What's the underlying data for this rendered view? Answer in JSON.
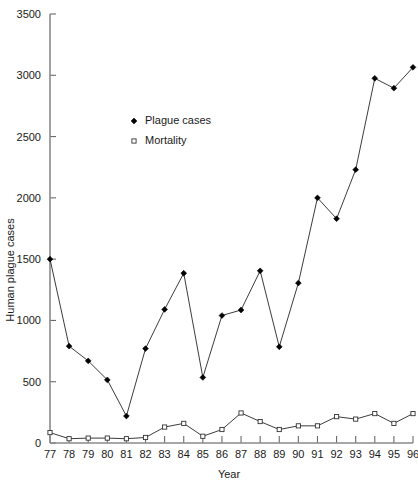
{
  "chart_data": {
    "type": "line",
    "title": "",
    "xlabel": "Year",
    "ylabel": "Human plague cases",
    "categories": [
      "77",
      "78",
      "79",
      "80",
      "81",
      "82",
      "83",
      "84",
      "85",
      "86",
      "87",
      "88",
      "89",
      "90",
      "91",
      "92",
      "93",
      "94",
      "95",
      "96"
    ],
    "x": [
      77,
      78,
      79,
      80,
      81,
      82,
      83,
      84,
      85,
      86,
      87,
      88,
      89,
      90,
      91,
      92,
      93,
      94,
      95,
      96
    ],
    "xlim": [
      77,
      96
    ],
    "ylim": [
      0,
      3500
    ],
    "yticks": [
      0,
      500,
      1000,
      1500,
      2000,
      2500,
      3000,
      3500
    ],
    "ytick_labels": [
      "0",
      "500",
      "1000",
      "1500",
      "2000",
      "2500",
      "3000",
      "3500"
    ],
    "grid": false,
    "legend_position": "upper-left-inside",
    "series": [
      {
        "name": "Plague cases",
        "marker": "filled-diamond",
        "values": [
          1500,
          790,
          670,
          515,
          220,
          770,
          1090,
          1385,
          535,
          1040,
          1085,
          1405,
          785,
          1305,
          2000,
          1830,
          2230,
          2975,
          2895,
          3065
        ]
      },
      {
        "name": "Mortality",
        "marker": "open-square",
        "values": [
          85,
          35,
          40,
          40,
          35,
          45,
          130,
          160,
          55,
          110,
          245,
          175,
          110,
          140,
          140,
          215,
          195,
          240,
          160,
          240
        ]
      }
    ]
  },
  "legend": {
    "entries": [
      {
        "label": "Plague cases",
        "marker": "filled-diamond"
      },
      {
        "label": "Mortality",
        "marker": "open-square"
      }
    ]
  },
  "axes": {
    "y_title": "Human plague cases",
    "x_title": "Year"
  }
}
